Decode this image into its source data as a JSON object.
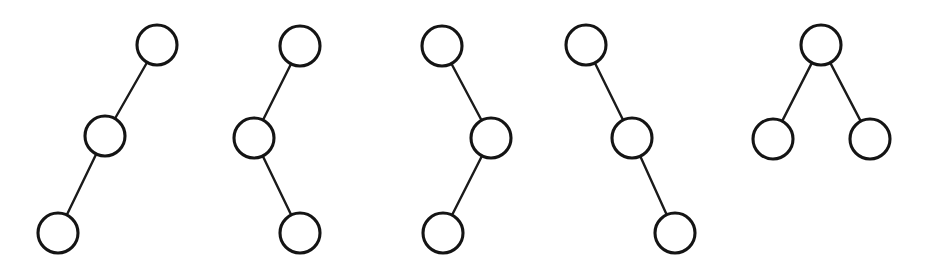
{
  "figure": {
    "background_color": "#ffffff",
    "node_fill_color": "#ffffff",
    "node_stroke_color": "#141414",
    "edge_color": "#1a1a1a",
    "node_radius": 20,
    "node_stroke_width": 3.1,
    "edge_stroke_width": 2.4,
    "canvas": {
      "width": 926,
      "height": 273
    },
    "tree_count": 5,
    "node_count_per_tree": 3
  },
  "trees": [
    {
      "index": 1,
      "name": "tree-1",
      "label": "left-leaning chain",
      "shape": "path descending to the lower left",
      "nodes": [
        {
          "id": "t1-n1",
          "role": "root",
          "cx": 157,
          "cy": 45,
          "r": 20
        },
        {
          "id": "t1-n2",
          "role": "middle",
          "cx": 105,
          "cy": 136,
          "r": 20
        },
        {
          "id": "t1-n3",
          "role": "leaf",
          "cx": 58,
          "cy": 233,
          "r": 20
        }
      ],
      "edges": [
        {
          "id": "t1-e1",
          "from": "t1-n1",
          "to": "t1-n2",
          "x1": 157,
          "y1": 45,
          "x2": 105,
          "y2": 136
        },
        {
          "id": "t1-e2",
          "from": "t1-n2",
          "to": "t1-n3",
          "x1": 105,
          "y1": 136,
          "x2": 58,
          "y2": 233
        }
      ]
    },
    {
      "index": 2,
      "name": "tree-2",
      "label": "zigzag left then right",
      "shape": "root top, middle offset left, leaf returning right",
      "nodes": [
        {
          "id": "t2-n1",
          "role": "root",
          "cx": 300,
          "cy": 46,
          "r": 20
        },
        {
          "id": "t2-n2",
          "role": "middle",
          "cx": 254,
          "cy": 138,
          "r": 20
        },
        {
          "id": "t2-n3",
          "role": "leaf",
          "cx": 300,
          "cy": 233,
          "r": 20
        }
      ],
      "edges": [
        {
          "id": "t2-e1",
          "from": "t2-n1",
          "to": "t2-n2",
          "x1": 300,
          "y1": 46,
          "x2": 254,
          "y2": 138
        },
        {
          "id": "t2-e2",
          "from": "t2-n2",
          "to": "t2-n3",
          "x1": 254,
          "y1": 138,
          "x2": 300,
          "y2": 233
        }
      ]
    },
    {
      "index": 3,
      "name": "tree-3",
      "label": "zigzag right then left",
      "shape": "root top left, middle offset right, leaf returning left",
      "nodes": [
        {
          "id": "t3-n1",
          "role": "root",
          "cx": 442,
          "cy": 46,
          "r": 20
        },
        {
          "id": "t3-n2",
          "role": "middle",
          "cx": 491,
          "cy": 138,
          "r": 20
        },
        {
          "id": "t3-n3",
          "role": "leaf",
          "cx": 443,
          "cy": 233,
          "r": 20
        }
      ],
      "edges": [
        {
          "id": "t3-e1",
          "from": "t3-n1",
          "to": "t3-n2",
          "x1": 442,
          "y1": 46,
          "x2": 491,
          "y2": 138
        },
        {
          "id": "t3-e2",
          "from": "t3-n2",
          "to": "t3-n3",
          "x1": 491,
          "y1": 138,
          "x2": 443,
          "y2": 233
        }
      ]
    },
    {
      "index": 4,
      "name": "tree-4",
      "label": "right-leaning chain",
      "shape": "path descending to the lower right",
      "nodes": [
        {
          "id": "t4-n1",
          "role": "root",
          "cx": 586,
          "cy": 45,
          "r": 20
        },
        {
          "id": "t4-n2",
          "role": "middle",
          "cx": 632,
          "cy": 138,
          "r": 20
        },
        {
          "id": "t4-n3",
          "role": "leaf",
          "cx": 675,
          "cy": 233,
          "r": 20
        }
      ],
      "edges": [
        {
          "id": "t4-e1",
          "from": "t4-n1",
          "to": "t4-n2",
          "x1": 586,
          "y1": 45,
          "x2": 632,
          "y2": 138
        },
        {
          "id": "t4-e2",
          "from": "t4-n2",
          "to": "t4-n3",
          "x1": 632,
          "y1": 138,
          "x2": 675,
          "y2": 233
        }
      ]
    },
    {
      "index": 5,
      "name": "tree-5",
      "label": "balanced fork",
      "shape": "root on top with two children below forming a V",
      "nodes": [
        {
          "id": "t5-n1",
          "role": "root",
          "cx": 821,
          "cy": 45,
          "r": 20
        },
        {
          "id": "t5-n2",
          "role": "left-child",
          "cx": 773,
          "cy": 139,
          "r": 20
        },
        {
          "id": "t5-n3",
          "role": "right-child",
          "cx": 870,
          "cy": 139,
          "r": 20
        }
      ],
      "edges": [
        {
          "id": "t5-e1",
          "from": "t5-n1",
          "to": "t5-n2",
          "x1": 821,
          "y1": 45,
          "x2": 773,
          "y2": 139
        },
        {
          "id": "t5-e2",
          "from": "t5-n1",
          "to": "t5-n3",
          "x1": 821,
          "y1": 45,
          "x2": 870,
          "y2": 139
        }
      ]
    }
  ]
}
